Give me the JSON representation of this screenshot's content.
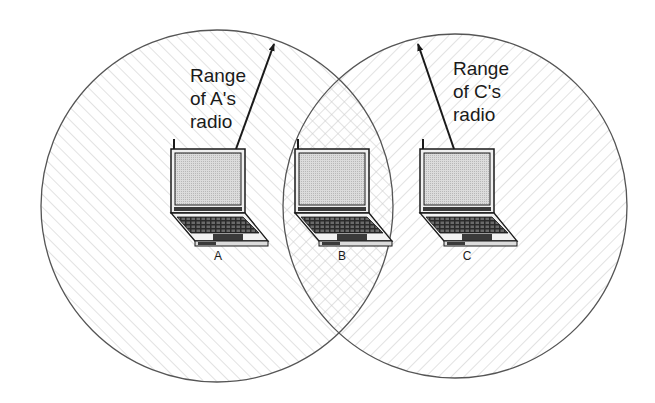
{
  "diagram": {
    "type": "wireless-hidden-terminal",
    "nodes": [
      {
        "id": "A",
        "label": "A",
        "x": 218,
        "lid_x": 171
      },
      {
        "id": "B",
        "label": "B",
        "x": 342,
        "lid_x": 295
      },
      {
        "id": "C",
        "label": "C",
        "x": 467,
        "lid_x": 420
      }
    ],
    "ranges": [
      {
        "id": "range-a",
        "owner": "A",
        "label_lines": [
          "Range",
          "of A's",
          "radio"
        ]
      },
      {
        "id": "range-c",
        "owner": "C",
        "label_lines": [
          "Range",
          "of C's",
          "radio"
        ]
      }
    ],
    "colors": {
      "stroke": "#555555",
      "hatch": "#c8c8c8",
      "screen": "#d4d4d4",
      "outline": "#1a1a1a",
      "text": "#1a1a1a"
    }
  }
}
